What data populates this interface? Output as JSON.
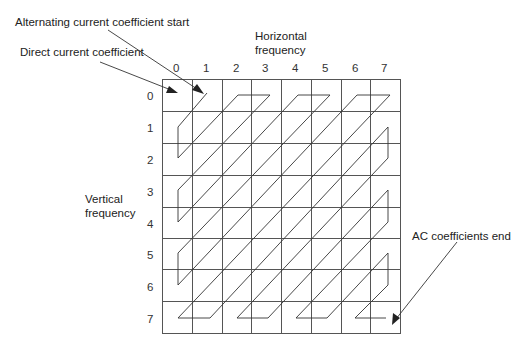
{
  "diagram": {
    "title_labels": {
      "ac_start": "Alternating current coefficient start",
      "dc": "Direct current coefficient",
      "ac_end": "AC coefficients end",
      "horizontal_axis": [
        "Horizontal",
        "frequency"
      ],
      "vertical_axis": [
        "Vertical",
        "frequency"
      ]
    },
    "grid": {
      "rows": 8,
      "cols": 8,
      "x0": 162,
      "y0": 79,
      "x1": 400,
      "y1": 333,
      "column_labels": [
        "0",
        "1",
        "2",
        "3",
        "4",
        "5",
        "6",
        "7"
      ],
      "row_labels": [
        "0",
        "1",
        "2",
        "3",
        "4",
        "5",
        "6",
        "7"
      ]
    },
    "scan_order": "zigzag",
    "colors": {
      "line": "#333333",
      "grid": "#555555",
      "text": "#222222",
      "background": "#ffffff"
    }
  }
}
